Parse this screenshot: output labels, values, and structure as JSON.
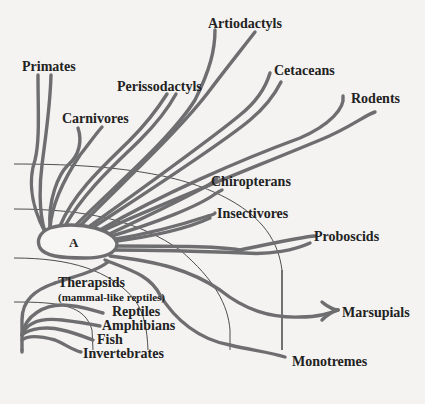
{
  "diagram": {
    "type": "evolutionary-tree",
    "colors": {
      "background": "#f4f3f1",
      "branch": "#6e6e70",
      "text": "#222222",
      "boundary": "#3a3a3c"
    },
    "center_node": {
      "label": "A"
    },
    "mammal_groups": [
      {
        "id": "primates",
        "label": "Primates"
      },
      {
        "id": "carnivores",
        "label": "Carnivores"
      },
      {
        "id": "perissodactyls",
        "label": "Perissodactyls"
      },
      {
        "id": "artiodactyls",
        "label": "Artiodactyls"
      },
      {
        "id": "cetaceans",
        "label": "Cetaceans"
      },
      {
        "id": "rodents",
        "label": "Rodents"
      },
      {
        "id": "chiropterans",
        "label": "Chiropterans"
      },
      {
        "id": "insectivores",
        "label": "Insectivores"
      },
      {
        "id": "proboscids",
        "label": "Proboscids"
      },
      {
        "id": "marsupials",
        "label": "Marsupials"
      },
      {
        "id": "monotremes",
        "label": "Monotremes"
      }
    ],
    "ancestral_groups": [
      {
        "id": "therapsids",
        "label": "Therapsids",
        "note": "(mammal-like reptiles)"
      },
      {
        "id": "reptiles",
        "label": "Reptiles"
      },
      {
        "id": "amphibians",
        "label": "Amphibians"
      },
      {
        "id": "fish",
        "label": "Fish"
      },
      {
        "id": "invertebrates",
        "label": "Invertebrates"
      }
    ]
  }
}
